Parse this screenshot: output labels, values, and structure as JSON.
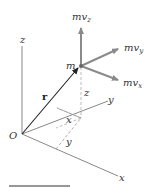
{
  "diagram": {
    "labels": {
      "origin": "O",
      "z_axis": "z",
      "y_axis": "y",
      "x_axis": "x",
      "mass": "m",
      "position_vector": "r",
      "z_coord": "z",
      "x_coord": "x",
      "y_coord": "y",
      "mvz_main": "mv",
      "mvz_sub": "z",
      "mvy_main": "mv",
      "mvy_sub": "y",
      "mvx_main": "mv",
      "mvx_sub": "x"
    },
    "colors": {
      "axis": "#888888",
      "momentum_arrow": "#8a8a8a",
      "position_vector": "#222222",
      "dashed": "#aaaaaa",
      "rule": "#333333"
    }
  }
}
